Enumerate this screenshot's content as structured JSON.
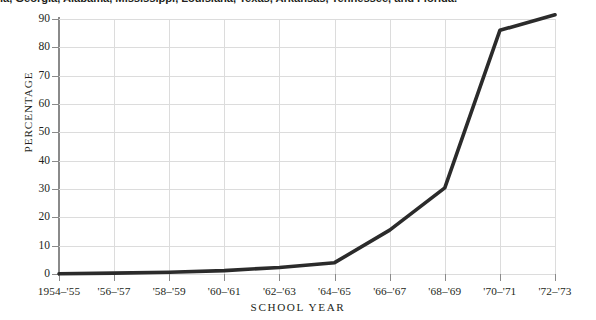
{
  "caption": {
    "text": "ia, Georgia, Alabama, Mississippi, Louisiana, Texas, Arkansas, Tennessee, and Florida."
  },
  "chart_data": {
    "type": "line",
    "title": "",
    "xlabel": "SCHOOL YEAR",
    "ylabel": "PERCENTAGE",
    "categories": [
      "1954–'55",
      "'56–'57",
      "'58–'59",
      "'60–'61",
      "'62–'63",
      "'64–'65",
      "'66–'67",
      "'68–'69",
      "'70–'71",
      "'72–'73"
    ],
    "values": [
      0.1,
      0.3,
      0.6,
      1.2,
      2.3,
      4.0,
      15.5,
      30.4,
      86.0,
      91.5
    ],
    "ylim": [
      0,
      90
    ],
    "yticks": [
      0,
      10,
      20,
      30,
      40,
      50,
      60,
      70,
      80,
      90
    ],
    "ytick_labels": [
      "0",
      "10",
      "20",
      "30",
      "40",
      "50",
      "60",
      "70",
      "80",
      "90"
    ],
    "grid": true,
    "legend": "none",
    "line_color": "#2b2b2b",
    "grid_color": "#dcdcdc",
    "axis_color": "#8a8a8a",
    "background_color": "#ffffff"
  }
}
